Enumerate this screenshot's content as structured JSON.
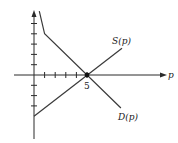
{
  "chart_data": {
    "type": "line",
    "title": "",
    "xlabel": "p",
    "ylabel": "",
    "grid": false,
    "legend": "inline labels",
    "xlim": [
      -1.9,
      12.5
    ],
    "ylim": [
      -6.2,
      6.2
    ],
    "x_ticks": [
      1,
      2,
      3,
      4,
      5
    ],
    "x_tick_labels": [
      {
        "value": 5,
        "label": "5"
      }
    ],
    "y_ticks_above": [
      1,
      2,
      3,
      4,
      5
    ],
    "y_ticks_below": [
      -1,
      -2,
      -3
    ],
    "series": [
      {
        "name": "S(p)",
        "label": "S(p)",
        "points": [
          [
            0,
            -4
          ],
          [
            8.3,
            2.6
          ]
        ]
      },
      {
        "name": "D(p)",
        "label": "D(p)",
        "points": [
          [
            0.5,
            6.2
          ],
          [
            1,
            4
          ],
          [
            8.2,
            -3.2
          ]
        ]
      }
    ],
    "annotations": [
      {
        "type": "point",
        "x": 5,
        "y": 0,
        "label": "5"
      }
    ]
  },
  "labels": {
    "axis_p": "p",
    "supply": "S(p)",
    "demand": "D(p)",
    "tick_five": "5"
  },
  "colors": {
    "line": "#2a2a2a",
    "background": "#ffffff"
  }
}
